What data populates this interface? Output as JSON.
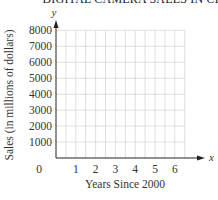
{
  "chart_data": {
    "type": "line",
    "title": "DIGITAL CAMERA SALES IN CHINA",
    "xlabel": "Years Since 2000",
    "ylabel": "Sales (in millions of dollars)",
    "x_axis_var": "x",
    "y_axis_var": "y",
    "x_ticks": [
      "0",
      "1",
      "2",
      "3",
      "4",
      "5",
      "6"
    ],
    "y_ticks": [
      "1000",
      "2000",
      "3000",
      "4000",
      "5000",
      "6000",
      "7000",
      "8000"
    ],
    "xlim": [
      0,
      6.5
    ],
    "ylim": [
      0,
      8000
    ],
    "grid": true,
    "grid_x_step": 0.5,
    "grid_y_step": 1000,
    "series": []
  }
}
